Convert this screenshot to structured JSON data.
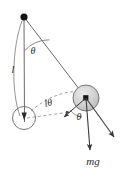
{
  "figure": {
    "type": "physics-free-body-diagram",
    "width": 125,
    "height": 178,
    "background_color": "#ffffff",
    "stroke_color": "#4a4a4a",
    "dark_stroke_color": "#2b2b2b",
    "ball_fill_color": "#d0d0d0",
    "labels": {
      "angle_pivot": "θ",
      "length": "l",
      "arc_displacement": "lθ",
      "angle_ball": "θ",
      "weight": "mg"
    },
    "geometry": {
      "pivot": {
        "x": 24,
        "y": 17,
        "name": "pivot-point"
      },
      "equilibrium_bob": {
        "cx": 24,
        "cy": 118,
        "r": 11
      },
      "displaced_bob": {
        "cx": 86,
        "cy": 98,
        "r": 13
      },
      "string_vertical": {
        "x1": 24,
        "y1": 17,
        "x2": 24,
        "y2": 121
      },
      "string_displaced": {
        "x1": 24,
        "y1": 17,
        "x2": 86,
        "y2": 98
      },
      "angle_arc_pivot": {
        "radius": 34
      },
      "arc_displacement_path": "dashed arc from equilibrium bob to displaced bob",
      "dashed_horizontal": {
        "x1": 26,
        "y1": 118,
        "x2": 72,
        "y2": 112
      },
      "vector_weight": {
        "x1": 86,
        "y1": 98,
        "x2": 90,
        "y2": 152
      },
      "vector_radial": {
        "x1": 86,
        "y1": 98,
        "x2": 115,
        "y2": 139
      },
      "vector_tangential": {
        "x1": 86,
        "y1": 98,
        "x2": 63,
        "y2": 117
      }
    }
  }
}
